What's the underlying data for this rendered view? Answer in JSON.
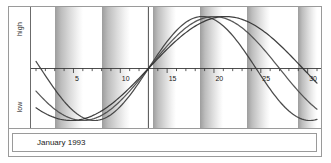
{
  "chart_data": {
    "type": "line",
    "title": "",
    "subtitle": "",
    "xlabel": "",
    "ylabel": "",
    "caption": "January 1993",
    "x": [
      1,
      31
    ],
    "xlim": [
      1,
      31
    ],
    "ylim": [
      -1,
      1
    ],
    "y_axis_labels": {
      "top": "high",
      "bottom": "low"
    },
    "xticks": [
      5,
      10,
      15,
      20,
      25,
      30
    ],
    "xtick_labels": [
      "5",
      "10",
      "15",
      "20",
      "25",
      "30"
    ],
    "minor_tick_every_days": 1,
    "grid": false,
    "legend_position": "none",
    "zero_line": true,
    "today_marker": {
      "label": "",
      "day": 13
    },
    "shaded_bands": [
      {
        "start_day": 3.0,
        "end_day": 6.0
      },
      {
        "start_day": 8.0,
        "end_day": 11.0
      },
      {
        "start_day": 13.5,
        "end_day": 16.0
      },
      {
        "start_day": 18.5,
        "end_day": 21.0
      },
      {
        "start_day": 23.5,
        "end_day": 26.0
      },
      {
        "start_day": 29.0,
        "end_day": 31.0
      }
    ],
    "series": [
      {
        "name": "physical",
        "period_days": 23,
        "phase_zero_up_day": 13.0,
        "color": "#3b3b3b",
        "points_day_value": [
          [
            1,
            0.6
          ],
          [
            2,
            0.42
          ],
          [
            3,
            0.22
          ],
          [
            4,
            0.0
          ],
          [
            5,
            -0.22
          ],
          [
            6,
            -0.42
          ],
          [
            7,
            -0.6
          ],
          [
            8,
            -0.76
          ],
          [
            9,
            -0.88
          ],
          [
            10,
            -0.96
          ],
          [
            11,
            -1.0
          ],
          [
            12,
            -0.72
          ],
          [
            13,
            0.0
          ],
          [
            14,
            0.27
          ],
          [
            15,
            0.52
          ],
          [
            16,
            0.72
          ],
          [
            17,
            0.88
          ],
          [
            18,
            0.97
          ],
          [
            19,
            1.0
          ],
          [
            20,
            0.97
          ],
          [
            21,
            0.88
          ],
          [
            22,
            0.72
          ],
          [
            23,
            0.52
          ],
          [
            24,
            0.27
          ],
          [
            25,
            0.0
          ],
          [
            26,
            -0.27
          ],
          [
            27,
            -0.52
          ],
          [
            28,
            -0.72
          ],
          [
            29,
            -0.88
          ],
          [
            30,
            -0.97
          ],
          [
            31,
            -1.0
          ]
        ]
      },
      {
        "name": "emotional",
        "period_days": 28,
        "phase_zero_up_day": 13.0,
        "color": "#4a4a4a",
        "points_day_value": [
          [
            1,
            0.5
          ],
          [
            2,
            0.3
          ],
          [
            3,
            0.1
          ],
          [
            4,
            -0.1
          ],
          [
            5,
            -0.32
          ],
          [
            6,
            -0.55
          ],
          [
            7,
            -0.72
          ],
          [
            8,
            -0.86
          ],
          [
            9,
            -0.96
          ],
          [
            10,
            -1.0
          ],
          [
            11,
            -0.92
          ],
          [
            12,
            -0.55
          ],
          [
            13,
            0.0
          ],
          [
            14,
            0.22
          ],
          [
            15,
            0.43
          ],
          [
            16,
            0.62
          ],
          [
            17,
            0.78
          ],
          [
            18,
            0.9
          ],
          [
            19,
            0.97
          ],
          [
            20,
            1.0
          ],
          [
            21,
            0.97
          ],
          [
            22,
            0.9
          ],
          [
            23,
            0.78
          ],
          [
            24,
            0.62
          ],
          [
            25,
            0.43
          ],
          [
            26,
            0.22
          ],
          [
            27,
            0.0
          ],
          [
            28,
            -0.22
          ],
          [
            29,
            -0.43
          ],
          [
            30,
            -0.62
          ],
          [
            31,
            -0.78
          ]
        ]
      },
      {
        "name": "intellectual",
        "period_days": 33,
        "phase_zero_up_day": 13.0,
        "color": "#2f2f2f",
        "points_day_value": [
          [
            1,
            -0.2
          ],
          [
            2,
            -0.38
          ],
          [
            3,
            -0.55
          ],
          [
            4,
            -0.7
          ],
          [
            5,
            -0.82
          ],
          [
            6,
            -0.91
          ],
          [
            7,
            -0.97
          ],
          [
            8,
            -1.0
          ],
          [
            9,
            -0.99
          ],
          [
            10,
            -0.9
          ],
          [
            11,
            -0.7
          ],
          [
            12,
            -0.4
          ],
          [
            13,
            0.0
          ],
          [
            14,
            0.19
          ],
          [
            15,
            0.37
          ],
          [
            16,
            0.54
          ],
          [
            17,
            0.69
          ],
          [
            18,
            0.82
          ],
          [
            19,
            0.91
          ],
          [
            20,
            0.97
          ],
          [
            21,
            1.0
          ],
          [
            22,
            0.99
          ],
          [
            23,
            0.94
          ],
          [
            24,
            0.86
          ],
          [
            25,
            0.74
          ],
          [
            26,
            0.59
          ],
          [
            27,
            0.42
          ],
          [
            28,
            0.24
          ],
          [
            29,
            0.05
          ],
          [
            30,
            -0.14
          ],
          [
            31,
            -0.33
          ]
        ]
      }
    ]
  },
  "colors": {
    "frame_border": "#9a9a9a",
    "axis_line": "#3a3a3a",
    "band_dark": "#9d9d9d",
    "band_light": "#ffffff",
    "curve": "#3b3b3b",
    "text": "#1a1a1a"
  }
}
